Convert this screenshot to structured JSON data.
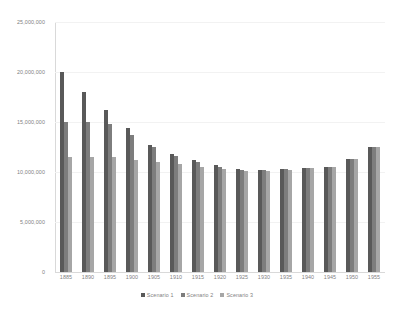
{
  "chart_data": {
    "type": "bar",
    "title": "",
    "xlabel": "",
    "ylabel": "",
    "ylim": [
      0,
      25000000
    ],
    "grid": true,
    "legend_position": "bottom",
    "categories": [
      "1885",
      "1890",
      "1895",
      "1900",
      "1905",
      "1910",
      "1915",
      "1920",
      "1925",
      "1930",
      "1935",
      "1940",
      "1945",
      "1950",
      "1955"
    ],
    "y_ticks": [
      {
        "value": 25000000,
        "label": "25,000,000"
      },
      {
        "value": 20000000,
        "label": "20,000,000"
      },
      {
        "value": 15000000,
        "label": "15,000,000"
      },
      {
        "value": 10000000,
        "label": "10,000,000"
      },
      {
        "value": 5000000,
        "label": "5,000,000"
      },
      {
        "value": 0,
        "label": "0"
      }
    ],
    "series": [
      {
        "name": "Scenario 1",
        "color": "#595959",
        "values": [
          20000000,
          18000000,
          16200000,
          14400000,
          12700000,
          11800000,
          11200000,
          10700000,
          10300000,
          10200000,
          10300000,
          10400000,
          10500000,
          11300000,
          12500000
        ]
      },
      {
        "name": "Scenario 2",
        "color": "#7d7d7d",
        "values": [
          15000000,
          15000000,
          14800000,
          13700000,
          12500000,
          11600000,
          11000000,
          10500000,
          10200000,
          10200000,
          10300000,
          10400000,
          10500000,
          11300000,
          12500000
        ]
      },
      {
        "name": "Scenario 3",
        "color": "#a6a6a6",
        "values": [
          11500000,
          11500000,
          11500000,
          11200000,
          11000000,
          10800000,
          10500000,
          10300000,
          10100000,
          10100000,
          10200000,
          10400000,
          10500000,
          11300000,
          12500000
        ]
      }
    ]
  }
}
